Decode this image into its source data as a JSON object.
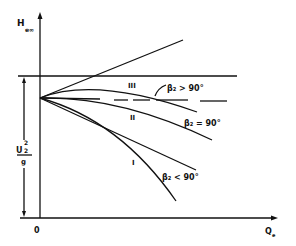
{
  "axes": {
    "y_label": "H",
    "y_label_sub": "e∞",
    "x_label": "Q",
    "x_label_sub": "e",
    "origin_label": "0"
  },
  "dimension": {
    "numerator": "U",
    "numerator_sup": "2",
    "numerator_sub": "2",
    "denominator": "g"
  },
  "curves": [
    {
      "id": "III",
      "label": "III",
      "annotation": "β₂ > 90°"
    },
    {
      "id": "II",
      "label": "II",
      "annotation": "β₂ = 90°"
    },
    {
      "id": "I",
      "label": "I",
      "annotation": "β₂ < 90°"
    }
  ],
  "colors": {
    "ink": "#111111",
    "background": "#ffffff"
  }
}
